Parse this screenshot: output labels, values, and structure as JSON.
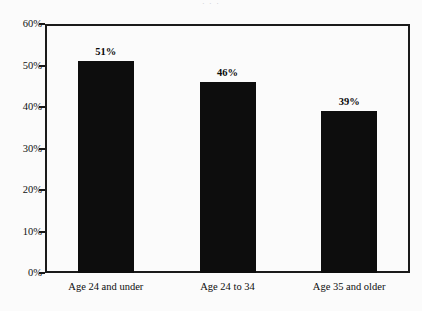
{
  "chart_data": {
    "type": "bar",
    "title": "",
    "xlabel": "",
    "ylabel": "",
    "categories": [
      "Age 24 and under",
      "Age 24 to 34",
      "Age 35 and older"
    ],
    "values": [
      51,
      46,
      39
    ],
    "value_labels": [
      "51%",
      "46%",
      "39%"
    ],
    "ylim": [
      0,
      60
    ],
    "yticks": [
      0,
      10,
      20,
      30,
      40,
      50,
      60
    ],
    "ytick_labels": [
      "0%",
      "10%",
      "20%",
      "30%",
      "40%",
      "50%",
      "60%"
    ],
    "grid": false,
    "legend": "none",
    "bar_color": "#0d0d0d",
    "axis_color": "#1a1a1a",
    "background_color": "#fbfbfb"
  },
  "top_cropped_text": "·              ·              ·"
}
